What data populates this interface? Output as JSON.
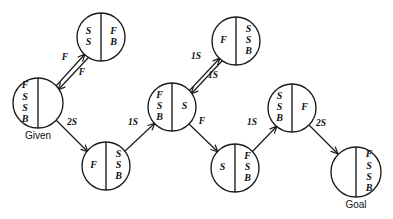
{
  "diagram": {
    "title": "Missionaries and cannibals style state-space search graph",
    "type": "state-space-graph",
    "width": 393,
    "height": 219,
    "background_color": "#ffffff",
    "stroke_color": "#1a1a1a",
    "nodes": [
      {
        "id": "given",
        "cx": 38,
        "cy": 103,
        "r": 25,
        "left": [
          "F",
          "S",
          "S",
          "B"
        ],
        "right": [],
        "caption": "Given"
      },
      {
        "id": "top-left",
        "cx": 101,
        "cy": 37,
        "r": 24,
        "left": [
          "S",
          "S"
        ],
        "right": [
          "F",
          "B"
        ],
        "caption": ""
      },
      {
        "id": "bottom-left",
        "cx": 106,
        "cy": 166,
        "r": 24,
        "left": [
          "F"
        ],
        "right": [
          "S",
          "S",
          "B"
        ],
        "caption": ""
      },
      {
        "id": "middle",
        "cx": 172,
        "cy": 107,
        "r": 24,
        "left": [
          "F",
          "S",
          "B"
        ],
        "right": [
          "S"
        ],
        "caption": ""
      },
      {
        "id": "top-right",
        "cx": 236,
        "cy": 41,
        "r": 24,
        "left": [
          "F"
        ],
        "right": [
          "S",
          "S",
          "B"
        ],
        "caption": ""
      },
      {
        "id": "bottom-right",
        "cx": 235,
        "cy": 168,
        "r": 24,
        "left": [
          "S"
        ],
        "right": [
          "F",
          "S",
          "B"
        ],
        "caption": ""
      },
      {
        "id": "upper-right",
        "cx": 292,
        "cy": 108,
        "r": 24,
        "left": [
          "S",
          "S",
          "B"
        ],
        "right": [
          "F"
        ],
        "caption": ""
      },
      {
        "id": "goal",
        "cx": 356,
        "cy": 172,
        "r": 25,
        "left": [],
        "right": [
          "F",
          "S",
          "S",
          "B"
        ],
        "caption": "Goal"
      }
    ],
    "edges": [
      {
        "id": "given-to-topleft",
        "from": "given",
        "to": "top-left",
        "label": "F",
        "label_x": 65,
        "label_y": 58,
        "x1": 56,
        "y1": 86,
        "x2": 85,
        "y2": 54
      },
      {
        "id": "topleft-to-given",
        "from": "top-left",
        "to": "given",
        "label": "F",
        "label_x": 82,
        "label_y": 73,
        "x1": 88,
        "y1": 58,
        "x2": 58,
        "y2": 90
      },
      {
        "id": "given-to-bottomleft",
        "from": "given",
        "to": "bottom-left",
        "label": "2S",
        "label_x": 72,
        "label_y": 123,
        "x1": 56,
        "y1": 120,
        "x2": 88,
        "y2": 152
      },
      {
        "id": "bottomleft-to-middle",
        "from": "bottom-left",
        "to": "middle",
        "label": "1S",
        "label_x": 133,
        "label_y": 123,
        "x1": 124,
        "y1": 152,
        "x2": 155,
        "y2": 123
      },
      {
        "id": "middle-to-topright",
        "from": "middle",
        "to": "top-right",
        "label": "1S",
        "label_x": 196,
        "label_y": 57,
        "x1": 189,
        "y1": 91,
        "x2": 220,
        "y2": 58
      },
      {
        "id": "topright-to-middle",
        "from": "top-right",
        "to": "middle",
        "label": "1S",
        "label_x": 213,
        "label_y": 76,
        "x1": 222,
        "y1": 61,
        "x2": 191,
        "y2": 94
      },
      {
        "id": "middle-to-bottomright",
        "from": "middle",
        "to": "bottom-right",
        "label": "F",
        "label_x": 202,
        "label_y": 122,
        "x1": 189,
        "y1": 124,
        "x2": 218,
        "y2": 152
      },
      {
        "id": "bottomright-to-upperright",
        "from": "bottom-right",
        "to": "upper-right",
        "label": "1S",
        "label_x": 252,
        "label_y": 123,
        "x1": 252,
        "y1": 152,
        "x2": 277,
        "y2": 126
      },
      {
        "id": "upperright-to-goal",
        "from": "upper-right",
        "to": "goal",
        "label": "2S",
        "label_x": 321,
        "label_y": 124,
        "x1": 309,
        "y1": 125,
        "x2": 338,
        "y2": 154
      }
    ]
  }
}
